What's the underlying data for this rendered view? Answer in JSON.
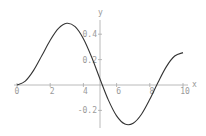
{
  "chart_data": {
    "type": "line",
    "title": "",
    "xlabel": "x",
    "ylabel": "y",
    "xlim": [
      0,
      10
    ],
    "ylim": [
      -0.31,
      0.5
    ],
    "grid": false,
    "legend": null,
    "x_ticks": [
      "0",
      "2",
      "4",
      "6",
      "8",
      "10"
    ],
    "y_ticks": [
      "0.4",
      "0.2",
      "-0.2"
    ],
    "series": [
      {
        "name": "y(x)",
        "x": [
          0,
          0.5,
          1,
          1.5,
          2,
          2.5,
          3,
          3.5,
          4,
          4.5,
          5,
          5.5,
          6,
          6.5,
          7,
          7.5,
          8,
          8.5,
          9,
          9.5,
          10
        ],
        "values": [
          0,
          0.031,
          0.115,
          0.232,
          0.353,
          0.446,
          0.486,
          0.459,
          0.364,
          0.218,
          0.047,
          -0.117,
          -0.243,
          -0.307,
          -0.301,
          -0.23,
          -0.113,
          0.022,
          0.145,
          0.228,
          0.255
        ]
      }
    ]
  },
  "colors": {
    "curve": "#333333",
    "axis": "#a0a0a0",
    "text": "#9a9a9a"
  }
}
